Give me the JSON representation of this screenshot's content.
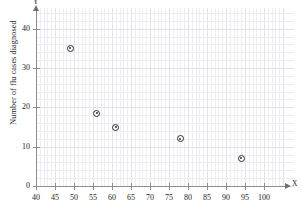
{
  "chart_data": {
    "type": "scatter",
    "title": "",
    "xlabel": "X",
    "ylabel": "Number of flu cases diagnosed",
    "axis_x_name": "X",
    "axis_y_name": "Y",
    "xlim": [
      40,
      105
    ],
    "ylim": [
      0,
      45
    ],
    "grid": true,
    "legend": "none",
    "x_ticks": [
      40,
      45,
      50,
      55,
      60,
      65,
      70,
      75,
      80,
      85,
      90,
      95,
      100
    ],
    "y_ticks": [
      0,
      10,
      20,
      30,
      40
    ],
    "origin_label": "0",
    "points": [
      {
        "x": 49,
        "y": 35
      },
      {
        "x": 56,
        "y": 18.5
      },
      {
        "x": 61,
        "y": 15
      },
      {
        "x": 78,
        "y": 12
      },
      {
        "x": 94,
        "y": 7
      }
    ],
    "series": [
      {
        "name": "flu cases",
        "x": [
          49,
          56,
          61,
          78,
          94
        ],
        "values": [
          35,
          18.5,
          15,
          12,
          7
        ]
      }
    ],
    "marker": "circle-dot",
    "marker_color": "#2e2e2e",
    "grid_color": "#ececf2",
    "axis_color": "#8e8e8e",
    "background": "#ffffff"
  }
}
